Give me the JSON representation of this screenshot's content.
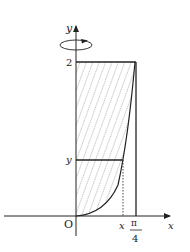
{
  "diagram": {
    "axes": {
      "x_label": "x",
      "y_label": "y",
      "origin_label": "O"
    },
    "labels": {
      "y_top_value": "2",
      "y_level": "y",
      "x_value": "x",
      "pi_num": "π",
      "pi_den": "4"
    },
    "rotation_indicator": "rotation-about-y-axis",
    "colors": {
      "line": "#222222",
      "hatch": "#9a9a9a",
      "background": "#ffffff"
    }
  }
}
